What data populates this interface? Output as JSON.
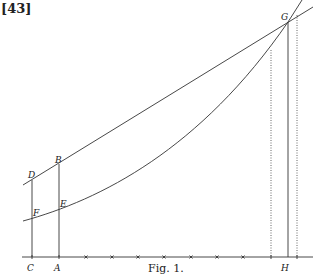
{
  "page": {
    "number": "[43]"
  },
  "figure": {
    "caption": "Fig. 1.",
    "ink_color": "#333333",
    "points": {
      "C": "C",
      "A": "A",
      "D": "D",
      "B": "B",
      "F": "F",
      "E": "E",
      "G": "G",
      "H": "H"
    },
    "baseline": {
      "y": 257,
      "x_start": 22,
      "x_end": 313
    },
    "tick_marks_x": [
      32,
      59,
      86,
      112,
      138,
      164,
      191,
      217,
      243,
      271,
      297
    ],
    "upper_line": {
      "description": "straight line through D, B and G",
      "from": [
        23,
        185
      ],
      "to": [
        313,
        7
      ]
    },
    "lower_curve": {
      "description": "convex curve through F, E and G",
      "from": [
        23,
        221
      ],
      "to": [
        302,
        0
      ]
    },
    "verticals": [
      {
        "name": "C-D",
        "x": 32,
        "from_y": 180,
        "style": "solid"
      },
      {
        "name": "A-B",
        "x": 59,
        "from_y": 164,
        "style": "solid"
      },
      {
        "name": "left-dotted",
        "x": 271,
        "from_y": 50,
        "style": "dotted"
      },
      {
        "name": "H-G",
        "x": 288,
        "from_y": 22,
        "style": "solid"
      },
      {
        "name": "right-dotted",
        "x": 297,
        "from_y": 15,
        "style": "dotted"
      }
    ]
  }
}
